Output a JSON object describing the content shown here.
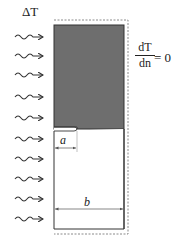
{
  "diagram": {
    "heat_label": "ΔT",
    "boundary_condition": {
      "numerator": "dT",
      "denominator": "dn",
      "equals": "= 0"
    },
    "dimensions": {
      "crack_length": "a",
      "width": "b"
    },
    "arrow_count": 10,
    "colors": {
      "shaded_region": "#6e6e6e",
      "outline": "#333333",
      "dashed": "#8a8a8a"
    }
  }
}
